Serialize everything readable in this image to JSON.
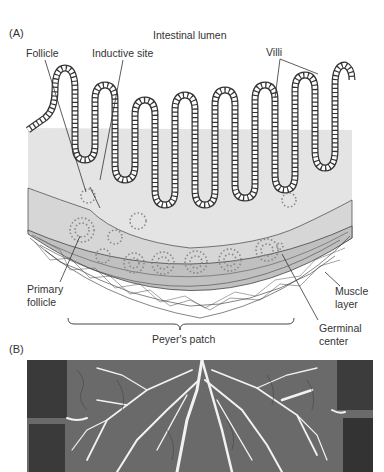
{
  "panel_a": {
    "label": "(A)",
    "title": "Intestinal lumen",
    "labels": {
      "follicle": "Follicle",
      "inductive_site": "Inductive site",
      "villi": "Villi",
      "m_cell": "M cell",
      "lamina_propria": "Lamina propria",
      "submucosa": "Submucosa",
      "primary_follicle_1": "Primary",
      "primary_follicle_2": "follicle",
      "muscle_layer_1": "Muscle",
      "muscle_layer_2": "layer",
      "peyers_patch": "Peyer's patch",
      "germinal_center_1": "Germinal",
      "germinal_center_2": "center"
    }
  },
  "panel_b": {
    "label": "(B)"
  },
  "colors": {
    "tissue_fill": "#e2e2e2",
    "submucosa_fill": "#d4d4d4",
    "muscle_fill": "#bdbdbd",
    "outline": "#333333",
    "dots": "#888888"
  }
}
